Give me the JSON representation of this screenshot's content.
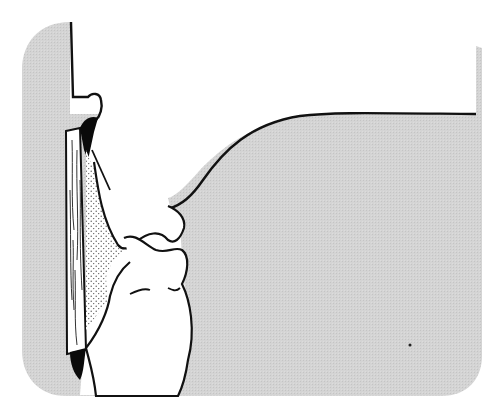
{
  "diagram": {
    "type": "illustration",
    "colors": {
      "background": "#ffffff",
      "panel_gray": "#d6d6d6",
      "outline": "#111111",
      "fill_white": "#ffffff",
      "stipple": "#555555",
      "dark_mass": "#0a0a0a"
    },
    "elements": [
      {
        "name": "gray-panel",
        "label": ""
      },
      {
        "name": "vertical-wall",
        "label": ""
      },
      {
        "name": "wooden-strip",
        "label": ""
      },
      {
        "name": "upper-form",
        "label": ""
      },
      {
        "name": "lower-form",
        "label": ""
      },
      {
        "name": "stippled-filler",
        "label": ""
      },
      {
        "name": "right-mass",
        "label": ""
      }
    ]
  }
}
